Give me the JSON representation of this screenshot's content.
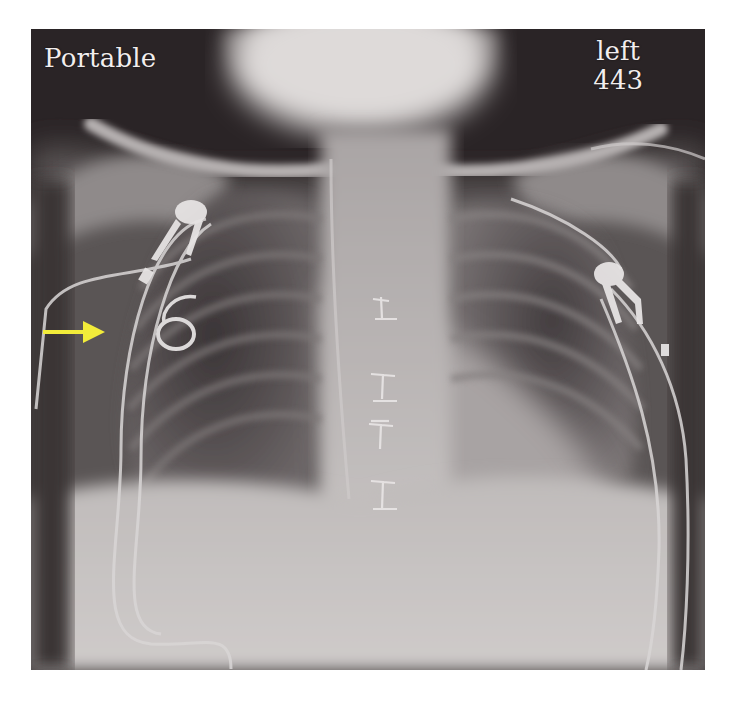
{
  "figure": {
    "type": "chest-radiograph",
    "view": "frontal (AP) chest X-ray",
    "overlay_labels": {
      "top_left": "Portable",
      "top_right_line1": "left",
      "top_right_line2": "443"
    },
    "annotations": [
      {
        "type": "arrow",
        "color": "#f2ec3a",
        "direction": "right",
        "points_to": "looped catheter in right upper chest"
      }
    ],
    "visible_features": [
      "bilateral chest wall monitoring leads with clips",
      "median sternotomy wires",
      "looped catheter in right hemithorax",
      "catheter tubing curving along right lateral chest"
    ]
  },
  "caption": {
    "text": "",
    "truncated": true
  },
  "colors": {
    "background": "#ffffff",
    "xray_dark": "#2a2426",
    "xray_light": "#d6d3d2",
    "label_text": "#f2eeee",
    "arrow": "#f2ec3a"
  }
}
